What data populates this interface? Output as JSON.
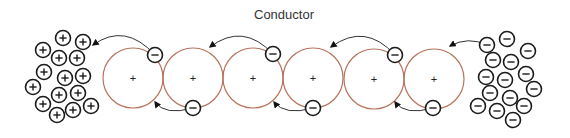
{
  "title": "Conductor",
  "colors": {
    "atom_stroke": "#b8735d",
    "particle_stroke": "#1a1a1a",
    "arrow": "#333333",
    "background": "#ffffff"
  },
  "positive_cluster": {
    "label": "positive charges (left)",
    "sign": "+",
    "particles": [
      [
        63,
        38
      ],
      [
        83,
        42
      ],
      [
        43,
        50
      ],
      [
        59,
        58
      ],
      [
        77,
        58
      ],
      [
        44,
        72
      ],
      [
        65,
        78
      ],
      [
        83,
        76
      ],
      [
        33,
        87
      ],
      [
        59,
        95
      ],
      [
        78,
        93
      ],
      [
        43,
        104
      ],
      [
        73,
        110
      ],
      [
        91,
        106
      ],
      [
        57,
        115
      ]
    ]
  },
  "negative_cluster": {
    "label": "negative charges (right)",
    "sign": "−",
    "particles": [
      [
        487,
        45
      ],
      [
        507,
        39
      ],
      [
        528,
        51
      ],
      [
        493,
        60
      ],
      [
        511,
        62
      ],
      [
        526,
        74
      ],
      [
        486,
        77
      ],
      [
        505,
        80
      ],
      [
        534,
        89
      ],
      [
        490,
        93
      ],
      [
        510,
        98
      ],
      [
        524,
        106
      ],
      [
        478,
        106
      ],
      [
        497,
        111
      ],
      [
        513,
        120
      ]
    ]
  },
  "conductor_atoms": {
    "radius": 30,
    "nucleus_sign": "+",
    "centers": [
      [
        133,
        78
      ],
      [
        193,
        78
      ],
      [
        253,
        78
      ],
      [
        313,
        78
      ],
      [
        374,
        79
      ],
      [
        434,
        79
      ]
    ]
  },
  "electrons": {
    "sign": "−",
    "top": [
      [
        155,
        55
      ],
      [
        273,
        54
      ],
      [
        395,
        55
      ]
    ],
    "bottom": [
      [
        193,
        108
      ],
      [
        313,
        108
      ],
      [
        433,
        108
      ]
    ]
  },
  "arrows": [
    {
      "from": [
        487,
        45
      ],
      "ctrl": [
        468,
        36
      ],
      "to": [
        450,
        46
      ]
    },
    {
      "from": [
        395,
        55
      ],
      "ctrl": [
        365,
        22
      ],
      "to": [
        331,
        47
      ]
    },
    {
      "from": [
        273,
        54
      ],
      "ctrl": [
        243,
        22
      ],
      "to": [
        210,
        47
      ]
    },
    {
      "from": [
        155,
        55
      ],
      "ctrl": [
        125,
        22
      ],
      "to": [
        93,
        45
      ]
    },
    {
      "from": [
        433,
        108
      ],
      "ctrl": [
        405,
        116
      ],
      "to": [
        395,
        102
      ]
    },
    {
      "from": [
        313,
        108
      ],
      "ctrl": [
        285,
        116
      ],
      "to": [
        274,
        102
      ]
    },
    {
      "from": [
        193,
        108
      ],
      "ctrl": [
        165,
        116
      ],
      "to": [
        155,
        102
      ]
    }
  ]
}
